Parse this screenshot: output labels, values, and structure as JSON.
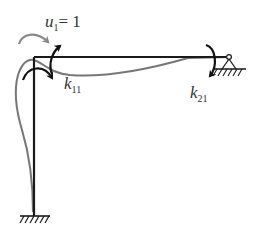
{
  "diagram": {
    "labels": {
      "u1": {
        "symbol": "u",
        "subscript": "1",
        "value": "= 1"
      },
      "k11": {
        "symbol": "k",
        "subscript": "11"
      },
      "k21": {
        "symbol": "k",
        "subscript": "21"
      }
    },
    "elements": {
      "column": {
        "from": [
          34,
          57
        ],
        "to": [
          34,
          216
        ]
      },
      "beam": {
        "from": [
          34,
          57
        ],
        "to": [
          229,
          57
        ]
      },
      "fixed_support": {
        "at": [
          34,
          216
        ]
      },
      "pin_support": {
        "at": [
          229,
          57
        ]
      }
    },
    "colors": {
      "member": "#1a1a1a",
      "deformed": "#777777",
      "rotation_arrow": "#888888",
      "moment_arrow": "#111111",
      "text": "#333333"
    }
  }
}
